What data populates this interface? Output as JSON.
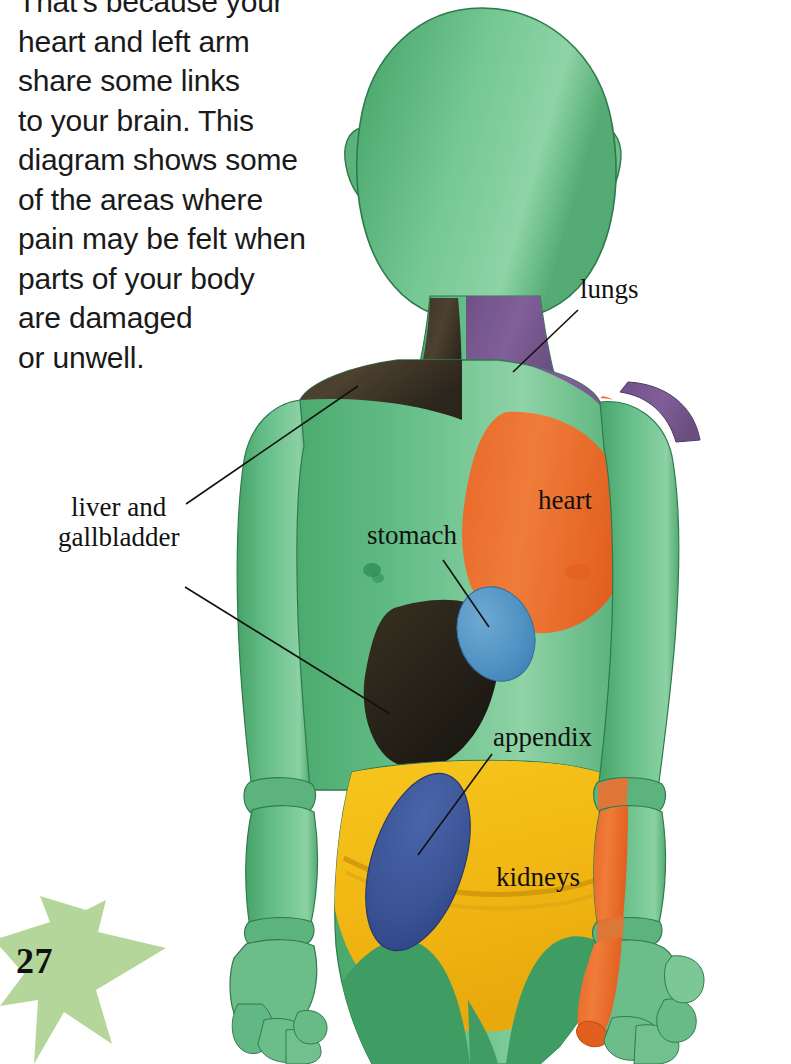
{
  "page": {
    "number": "27",
    "star_color": "#b5d69a",
    "background": "#ffffff"
  },
  "body_text": "That's because your\nheart and left arm\nshare some links\nto your brain. This\ndiagram shows some\nof the areas where\npain may be felt when\nparts of your body\nare damaged\nor unwell.",
  "figure": {
    "regions": [
      {
        "name": "lungs",
        "color": "#7b5c92",
        "area": "right side of neck and right shoulder"
      },
      {
        "name": "heart",
        "color": "#ee7433",
        "area": "left chest and down the inner left arm to the hand"
      },
      {
        "name": "liver and gallbladder",
        "color": "#4a3c2a",
        "area": "right shoulder and right upper abdomen"
      },
      {
        "name": "stomach",
        "color": "#5193c4",
        "area": "upper central abdomen"
      },
      {
        "name": "kidneys",
        "color": "#f5c01e",
        "area": "lower abdomen and hips"
      },
      {
        "name": "appendix",
        "color": "#3a5496",
        "area": "lower right abdomen"
      },
      {
        "name": "body",
        "color": "#55b27a",
        "area": "mannequin skin"
      }
    ]
  },
  "labels": {
    "lungs": "lungs",
    "heart": "heart",
    "stomach": "stomach",
    "liver_gallbladder": "liver and\ngallbladder",
    "appendix": "appendix",
    "kidneys": "kidneys"
  }
}
